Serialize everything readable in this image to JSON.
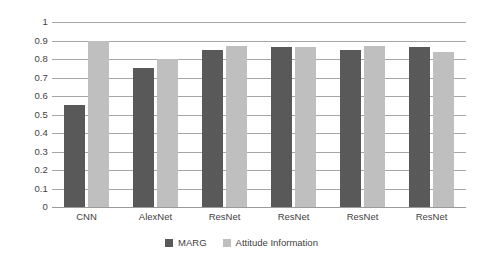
{
  "chart_data": {
    "type": "bar",
    "title": "",
    "xlabel": "",
    "ylabel": "",
    "ylim": [
      0,
      1
    ],
    "ytick_labels": [
      "1",
      "0.9",
      "0.8",
      "0.7",
      "0.6",
      "0.5",
      "0.4",
      "0.3",
      "0.2",
      "0.1",
      "0"
    ],
    "ytick_values": [
      1,
      0.9,
      0.8,
      0.7,
      0.6,
      0.5,
      0.4,
      0.3,
      0.2,
      0.1,
      0
    ],
    "grid": true,
    "legend_position": "bottom",
    "categories": [
      "CNN",
      "AlexNet",
      "ResNet",
      "ResNet",
      "ResNet",
      "ResNet"
    ],
    "series": [
      {
        "name": "MARG",
        "color": "#595959",
        "values": [
          0.55,
          0.75,
          0.85,
          0.865,
          0.85,
          0.865
        ]
      },
      {
        "name": "Attitude Information",
        "color": "#bfbfbf",
        "values": [
          0.9,
          0.8,
          0.87,
          0.865,
          0.87,
          0.84
        ]
      }
    ]
  },
  "axis": {
    "gridline_color": "#a6a6a6"
  }
}
